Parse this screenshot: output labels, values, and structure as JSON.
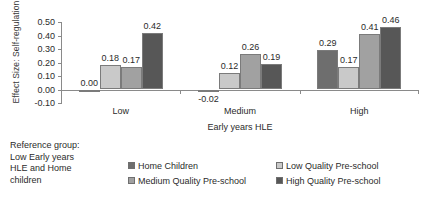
{
  "chart_data": {
    "type": "bar",
    "title": "",
    "xlabel": "Early years HLE",
    "ylabel": "Effect Size: Self-regulation",
    "categories": [
      "Low",
      "Medium",
      "High"
    ],
    "ylim": [
      -0.1,
      0.5
    ],
    "ytick_step": 0.1,
    "yticks": [
      "0.50",
      "0.40",
      "0.30",
      "0.20",
      "0.10",
      "0.00",
      "-0.10"
    ],
    "ytick_values": [
      0.5,
      0.4,
      0.3,
      0.2,
      0.1,
      0.0,
      -0.1
    ],
    "grid": false,
    "legend_position": "bottom",
    "series": [
      {
        "name": "Home Children",
        "color": "#6e6e6e",
        "values": [
          0.0,
          -0.02,
          0.29
        ],
        "labels": [
          "0.00",
          "-0.02",
          "0.29"
        ]
      },
      {
        "name": "Low Quality Pre-school",
        "color": "#c9c9c9",
        "values": [
          0.18,
          0.12,
          0.17
        ],
        "labels": [
          "0.18",
          "0.12",
          "0.17"
        ]
      },
      {
        "name": "Medium Quality Pre-school",
        "color": "#a1a1a1",
        "values": [
          0.17,
          0.26,
          0.41
        ],
        "labels": [
          "0.17",
          "0.26",
          "0.41"
        ]
      },
      {
        "name": "High Quality Pre-school",
        "color": "#575757",
        "values": [
          0.42,
          0.19,
          0.46
        ],
        "labels": [
          "0.42",
          "0.19",
          "0.46"
        ]
      }
    ],
    "annotations": [
      "Reference group:",
      "Low Early years",
      "HLE and Home",
      "children"
    ],
    "annotation_text": "Reference group: Low Early years HLE and Home children"
  }
}
